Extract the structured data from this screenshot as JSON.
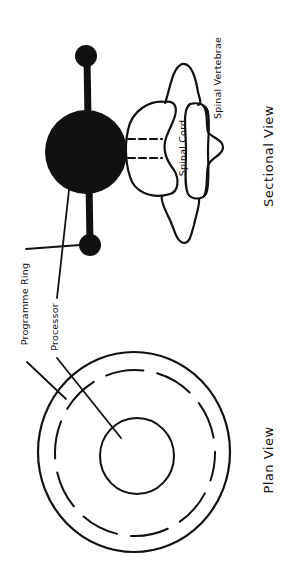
{
  "diagram": {
    "views": [
      {
        "id": "sectional",
        "title": "Sectional View"
      },
      {
        "id": "plan",
        "title": "Plan View"
      }
    ],
    "labels": {
      "programme_ring": "Programme Ring",
      "processor": "Processor",
      "spinal_cord": "Spinal Cord",
      "spinal_vertebrae": "Spinal Vertebrae",
      "sectional_view": "Sectional View",
      "plan_view": "Plan View"
    },
    "colors": {
      "ink": "#111111",
      "background": "#ffffff"
    },
    "components": [
      {
        "name": "processor",
        "shape": "filled-ball",
        "view": "sectional"
      },
      {
        "name": "programme-ring",
        "shape": "ring-with-end-knobs",
        "view": "sectional"
      },
      {
        "name": "spinal-cord",
        "view": "sectional"
      },
      {
        "name": "spinal-vertebrae",
        "view": "sectional"
      },
      {
        "name": "processor",
        "shape": "inner-circle",
        "view": "plan"
      },
      {
        "name": "programme-ring",
        "shape": "dashed-ring",
        "view": "plan"
      }
    ],
    "orientation": "rotated -90deg (text reads bottom-to-top)"
  }
}
